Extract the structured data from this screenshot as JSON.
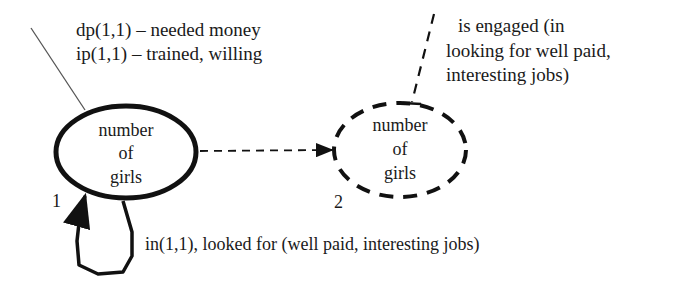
{
  "diagram": {
    "nodes": [
      {
        "id": "node-1",
        "label_lines": [
          "number",
          "of",
          "girls"
        ],
        "index_label": "1",
        "style": "solid"
      },
      {
        "id": "node-2",
        "label_lines": [
          "number",
          "of",
          "girls"
        ],
        "index_label": "2",
        "style": "dashed"
      }
    ],
    "annotations": {
      "top_left": [
        "dp(1,1) – needed money",
        "ip(1,1) – trained, willing"
      ],
      "top_right": [
        "is engaged (in",
        "looking for well paid,",
        "interesting jobs)"
      ],
      "loop": "in(1,1), looked for (well paid, interesting jobs)"
    },
    "edges": [
      {
        "from": "node-1",
        "to": "node-2",
        "style": "dashed-arrow"
      },
      {
        "from": "node-1",
        "to": "node-1",
        "style": "solid-self-loop"
      }
    ],
    "colors": {
      "stroke": "#111111",
      "text": "#1a1a1a",
      "background": "#ffffff"
    }
  }
}
